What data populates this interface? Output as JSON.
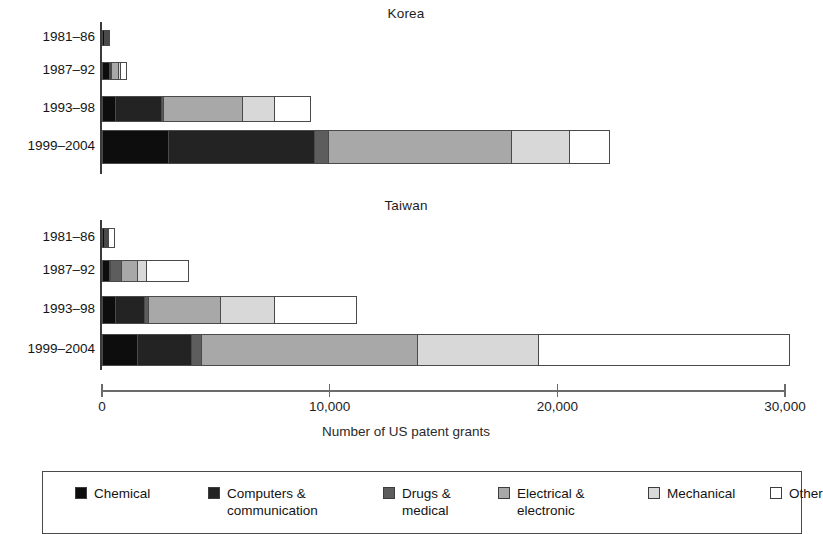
{
  "chart_data": {
    "type": "bar",
    "orientation": "horizontal",
    "stacked": true,
    "xlabel": "Number of US patent grants",
    "ylabel": "",
    "xlim": [
      0,
      30000
    ],
    "xticks": [
      0,
      10000,
      20000,
      30000
    ],
    "xticklabels": [
      "0",
      "10,000",
      "20,000",
      "30,000"
    ],
    "grid": false,
    "legend_position": "bottom",
    "categories": [
      "1981–86",
      "1987–92",
      "1993–98",
      "1999–2004"
    ],
    "series": [
      {
        "name": "Chemical",
        "color": "#0d0d0d"
      },
      {
        "name": "Computers & communication",
        "color": "#232323"
      },
      {
        "name": "Drugs & medical",
        "color": "#5d5d5d"
      },
      {
        "name": "Electrical & electronic",
        "color": "#a8a8a8"
      },
      {
        "name": "Mechanical",
        "color": "#d8d8d8"
      },
      {
        "name": "Other",
        "color": "#ffffff"
      }
    ],
    "panels": [
      {
        "title": "Korea",
        "rows": [
          {
            "category": "1981–86",
            "values": [
              150,
              60,
              10,
              30,
              40,
              60
            ],
            "total": 350
          },
          {
            "category": "1987–92",
            "values": [
              330,
              90,
              40,
              370,
              130,
              330
            ],
            "total": 1290
          },
          {
            "category": "1993–98",
            "values": [
              600,
              2100,
              130,
              3500,
              1450,
              1600
            ],
            "total": 9380
          },
          {
            "category": "1999–2004",
            "values": [
              2950,
              6460,
              660,
              8050,
              2600,
              1800
            ],
            "total": 22520
          }
        ]
      },
      {
        "title": "Taiwan",
        "rows": [
          {
            "category": "1981–86",
            "values": [
              120,
              80,
              20,
              70,
              110,
              300
            ],
            "total": 700
          },
          {
            "category": "1987–92",
            "values": [
              330,
              90,
              550,
              730,
              450,
              1900
            ],
            "total": 4050
          },
          {
            "category": "1993–98",
            "values": [
              620,
              1320,
              220,
              3210,
              2420,
              3610
            ],
            "total": 11400
          },
          {
            "category": "1999–2004",
            "values": [
              1580,
              2420,
              480,
              9550,
              5320,
              11100
            ],
            "total": 30450
          }
        ]
      }
    ]
  },
  "panels": {
    "korea": {
      "title": "Korea"
    },
    "taiwan": {
      "title": "Taiwan"
    }
  },
  "axis": {
    "title": "Number of US patent grants",
    "tick_0": "0",
    "tick_1": "10,000",
    "tick_2": "20,000",
    "tick_3": "30,000"
  },
  "row_labels": {
    "r0": "1981–86",
    "r1": "1987–92",
    "r2": "1993–98",
    "r3": "1999–2004"
  },
  "legend": {
    "items": [
      {
        "label": "Chemical",
        "color": "#0d0d0d"
      },
      {
        "label": "Computers &\ncommunication",
        "color": "#232323"
      },
      {
        "label": "Drugs &\nmedical",
        "color": "#5d5d5d"
      },
      {
        "label": "Electrical &\nelectronic",
        "color": "#a8a8a8"
      },
      {
        "label": "Mechanical",
        "color": "#d8d8d8"
      },
      {
        "label": "Other",
        "color": "#ffffff"
      }
    ]
  }
}
